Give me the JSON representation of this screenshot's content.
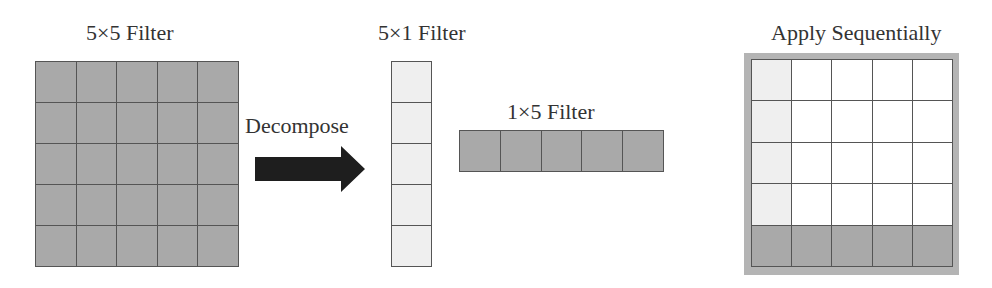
{
  "colors": {
    "dark_filter": "#a9a9a9",
    "light_filter": "#efefef",
    "empty": "#ffffff",
    "frame": "#b4b4b4",
    "arrow": "#1e1e1e",
    "grid_line": "#555555"
  },
  "labels": {
    "filter_5x5": "5×5 Filter",
    "decompose": "Decompose",
    "filter_5x1": "5×1 Filter",
    "filter_1x5": "1×5 Filter",
    "apply": "Apply Sequentially"
  },
  "icons": {
    "arrow": "right-arrow-icon"
  }
}
